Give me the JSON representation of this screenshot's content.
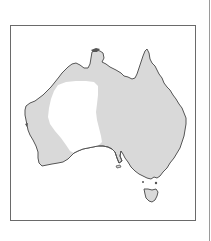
{
  "map": {
    "subject": "Australia distribution map",
    "colors": {
      "range_fill": "#d9d9d9",
      "excluded_fill": "#ffffff",
      "coastline": "#555555",
      "frame": "#6a6a6a",
      "background": "#ffffff"
    },
    "regions": [
      {
        "name": "mainland",
        "shaded": true
      },
      {
        "name": "tasmania",
        "shaded": true
      },
      {
        "name": "central-western-desert",
        "shaded": false
      }
    ]
  }
}
